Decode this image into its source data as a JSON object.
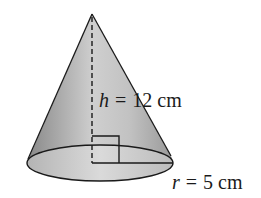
{
  "diagram": {
    "type": "cone",
    "height_label": {
      "variable": "h",
      "equals": "=",
      "value": "12 cm"
    },
    "radius_label": {
      "variable": "r",
      "equals": "=",
      "value": "5 cm"
    },
    "annotations": [
      "right-angle-marker",
      "dashed-height-line",
      "radius-line"
    ],
    "colors": {
      "stroke": "#1a1a1a",
      "fill_dark": "#8c8c8c",
      "fill_light": "#d4d4d4",
      "base_fill": "#c8c8c8"
    }
  }
}
